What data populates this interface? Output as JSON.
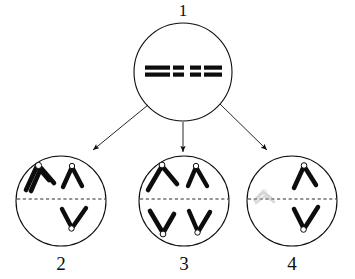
{
  "figure": {
    "title": "",
    "kind": "cell-division-chromosome-diagram",
    "background_color": "#ffffff",
    "ink_color": "#0d0d0d",
    "faint_ink_color": "#b9b9b9",
    "width": 355,
    "height": 279
  },
  "labels": {
    "parent": "1",
    "daughter_a": "2",
    "daughter_b": "3",
    "daughter_c": "4"
  },
  "cells": [
    {
      "id": "cell-1",
      "label": "1",
      "role": "parent-cell",
      "center": {
        "x": 183,
        "y": 72
      },
      "radius": 49,
      "has_equator_line": false,
      "chromosome_count": 4,
      "chromosome_style": "paired-horizontal-bars",
      "description": "Two homologous pairs shown as thick horizontal double bars at the cell equator"
    },
    {
      "id": "cell-2",
      "label": "2",
      "role": "daughter-cell",
      "center": {
        "x": 61,
        "y": 201
      },
      "radius": 45,
      "has_equator_line": true,
      "chromosome_count": 4,
      "chromosome_style": "v-shapes",
      "description": "Doubled V above left, single inverted-V above right, single V below right"
    },
    {
      "id": "cell-3",
      "label": "3",
      "role": "daughter-cell",
      "center": {
        "x": 184,
        "y": 201
      },
      "radius": 45,
      "has_equator_line": true,
      "chromosome_count": 4,
      "chromosome_style": "v-shapes",
      "description": "Two inverted-V chromosomes above equator, two V chromosomes below equator"
    },
    {
      "id": "cell-4",
      "label": "4",
      "role": "daughter-cell",
      "center": {
        "x": 292,
        "y": 201
      },
      "radius": 45,
      "has_equator_line": true,
      "chromosome_count": 2,
      "chromosome_style": "v-shapes",
      "has_erased_mark": true,
      "description": "Faint erased smudge left of equator, one inverted-V above right, one V below right"
    }
  ],
  "arrows": [
    {
      "id": "arrow-1-to-2",
      "from": "cell-1",
      "to": "cell-2"
    },
    {
      "id": "arrow-1-to-3",
      "from": "cell-1",
      "to": "cell-3"
    },
    {
      "id": "arrow-1-to-4",
      "from": "cell-1",
      "to": "cell-4"
    }
  ]
}
